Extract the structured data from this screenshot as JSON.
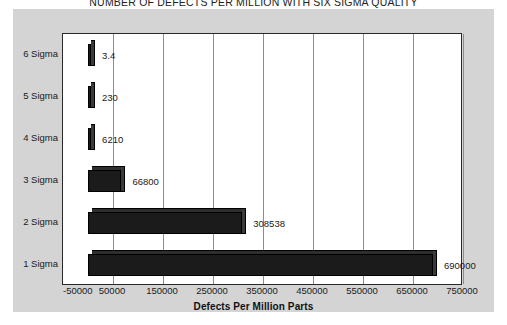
{
  "chart_data": {
    "type": "bar",
    "orientation": "horizontal",
    "title": "NUMBER OF DEFECTS PER MILLION WITH SIX SIGMA QUALITY",
    "xlabel": "Defects Per Million Parts",
    "ylabel": "",
    "categories": [
      "6 Sigma",
      "5 Sigma",
      "4 Sigma",
      "3 Sigma",
      "2 Sigma",
      "1 Sigma"
    ],
    "values": [
      3.4,
      230,
      6210,
      66800,
      308538,
      690000
    ],
    "data_labels": [
      "3.4",
      "230",
      "6210",
      "66800",
      "308538",
      "690000"
    ],
    "xlim": [
      -50000,
      750000
    ],
    "xticks": [
      -50000,
      50000,
      150000,
      250000,
      350000,
      450000,
      550000,
      650000,
      750000
    ],
    "xtick_labels": [
      "-50000",
      "50000",
      "150000",
      "250000",
      "350000",
      "450000",
      "550000",
      "650000",
      "750000"
    ],
    "grid": true,
    "grid_axis": "x",
    "legend": false,
    "bar_color": "#1b1b1b",
    "plot_background": "#ffffff",
    "panel_background": "#d4d4d4",
    "border_color": "#2a2a2a",
    "gridline_color": "#8d8d8d"
  }
}
